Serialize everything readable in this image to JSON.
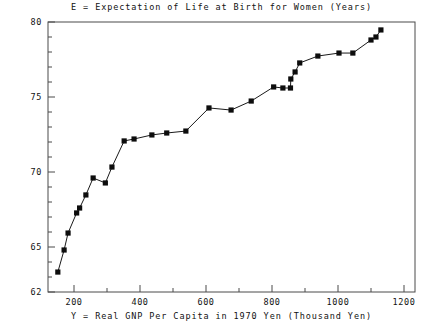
{
  "chart_data": {
    "type": "line",
    "title": "E = Expectation of Life at Birth for Women (Years)",
    "xlabel": "Y = Real GNP Per Capita in 1970 Yen (Thousand Yen)",
    "ylabel": "",
    "xlim": [
      120,
      1230
    ],
    "ylim": [
      62,
      80
    ],
    "xticks": [
      200,
      400,
      600,
      800,
      1000,
      1200
    ],
    "xtick_labels": [
      "200",
      "400",
      "600",
      "800",
      "1000",
      "1200"
    ],
    "xminor_step": 100,
    "yticks": [
      65,
      70,
      75,
      80
    ],
    "ytick_labels": [
      "65",
      "70",
      "75",
      "80"
    ],
    "yminor_step": 1,
    "grid": false,
    "legend": false,
    "marker": "filled-square",
    "series": [
      {
        "name": "Expectation of life at birth for women",
        "x": [
          151,
          170,
          182,
          208,
          217,
          236,
          258,
          295,
          315,
          352,
          382,
          436,
          481,
          539,
          609,
          676,
          737,
          805,
          833,
          856,
          857,
          870,
          884,
          939,
          1003,
          1045,
          1100,
          1115,
          1130
        ],
        "y": [
          63.33,
          64.8,
          65.93,
          67.27,
          67.6,
          68.47,
          69.6,
          69.27,
          70.33,
          72.07,
          72.2,
          72.47,
          72.6,
          72.73,
          74.27,
          74.13,
          74.73,
          75.67,
          75.6,
          75.6,
          76.2,
          76.67,
          77.27,
          77.73,
          77.93,
          77.93,
          78.8,
          79.0,
          79.47
        ]
      }
    ]
  },
  "axis": {
    "top_value_label": "80",
    "bottom_value_label": "62"
  }
}
